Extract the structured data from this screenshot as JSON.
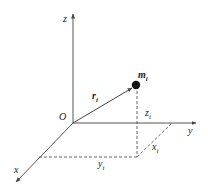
{
  "diagram": {
    "type": "3d-coordinate-system",
    "axes": {
      "z": {
        "label": "z"
      },
      "y": {
        "label": "y"
      },
      "x": {
        "label": "x"
      }
    },
    "origin_label": "O",
    "point": {
      "label_main": "m",
      "label_sub": "i"
    },
    "vector": {
      "label_main": "r",
      "label_sub": "i"
    },
    "components": {
      "z": {
        "label_main": "z",
        "label_sub": "i"
      },
      "x": {
        "label_main": "x",
        "label_sub": "i"
      },
      "y": {
        "label_main": "y",
        "label_sub": "i"
      }
    },
    "colors": {
      "line": "#444444",
      "dashed": "#555555",
      "point": "#111111"
    }
  }
}
